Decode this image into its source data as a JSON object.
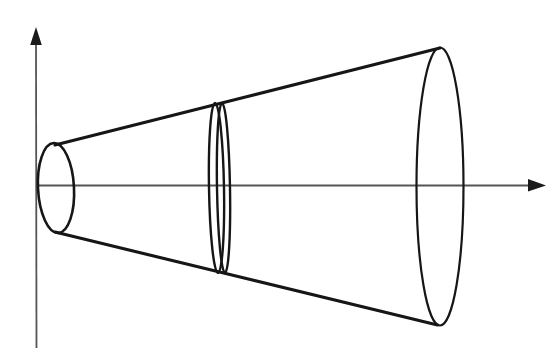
{
  "figure": {
    "background_color": "#ffffff",
    "stroke_color": "#161618",
    "axis_color": "#555558",
    "width": 560,
    "height": 363
  },
  "axes": {
    "vertical": {
      "name": "y-axis",
      "x": 36,
      "y_top": 28,
      "y_bottom": 348,
      "arrow": "up",
      "label": ""
    },
    "horizontal": {
      "name": "x-axis",
      "y": 185,
      "x_left": 36,
      "x_right": 545,
      "arrow": "right",
      "label": ""
    },
    "origin": {
      "x": 36,
      "y": 185
    }
  },
  "shapes": {
    "apex_disk": {
      "name": "small-left-ellipse",
      "cx": 56,
      "cy": 188,
      "rx": 18,
      "ry": 45,
      "rotation": -3
    },
    "cross_section": {
      "name": "middle-cross-section-disk",
      "front_ellipse": {
        "cx": 216.5,
        "cy": 188,
        "rx": 7.5,
        "ry": 85,
        "rotation": -1
      },
      "back_ellipse": {
        "cx": 223.5,
        "cy": 188,
        "rx": 6.5,
        "ry": 85,
        "rotation": -1
      }
    },
    "base_disk": {
      "name": "large-right-ellipse",
      "cx": 440,
      "cy": 186.5,
      "rx": 23.5,
      "ry": 139,
      "rotation": 0
    },
    "generators": [
      {
        "name": "upper-generator-line",
        "x1": 55,
        "y1": 145,
        "x2": 440,
        "y2": 48
      },
      {
        "name": "lower-generator-line",
        "x1": 55,
        "y1": 232,
        "x2": 437.5,
        "y2": 325
      }
    ]
  },
  "chart_data": {
    "type": "diagram",
    "xlabel": "",
    "ylabel": "",
    "elements": [
      {
        "label": "small left ellipse (narrow end)",
        "center_x": 56,
        "center_y": 188,
        "semi_axis_x": 18,
        "semi_axis_y": 45
      },
      {
        "label": "middle cross-section disk",
        "center_x": 220,
        "center_y": 188,
        "semi_axis_x": 7,
        "semi_axis_y": 85
      },
      {
        "label": "large right ellipse (base)",
        "center_x": 440,
        "center_y": 186,
        "semi_axis_x": 23,
        "semi_axis_y": 139
      }
    ],
    "axis_ranges": {
      "x": [
        36,
        545
      ],
      "y": [
        28,
        348
      ]
    },
    "grid": false,
    "legend": "none"
  }
}
